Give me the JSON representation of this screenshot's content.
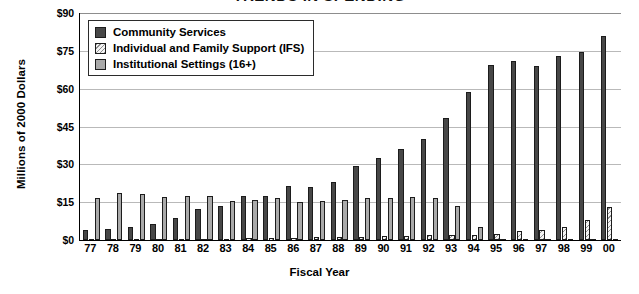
{
  "chart_data": {
    "type": "bar",
    "title": "TRENDS IN SPENDING",
    "xlabel": "Fiscal Year",
    "ylabel": "Millions of 2000 Dollars",
    "ylim": [
      0,
      90
    ],
    "yticks": [
      0,
      15,
      30,
      45,
      60,
      75,
      90
    ],
    "ytick_labels": [
      "$0",
      "$15",
      "$30",
      "$45",
      "$60",
      "$75",
      "$90"
    ],
    "grid": true,
    "legend_position": "top-left-inside",
    "categories": [
      "77",
      "78",
      "79",
      "80",
      "81",
      "82",
      "83",
      "84",
      "85",
      "86",
      "87",
      "88",
      "89",
      "90",
      "91",
      "92",
      "93",
      "94",
      "95",
      "96",
      "97",
      "98",
      "99",
      "00"
    ],
    "series": [
      {
        "name": "Community Services",
        "color": "#474747",
        "fill": "solid",
        "values": [
          4.0,
          4.3,
          5.0,
          6.5,
          8.8,
          12.3,
          13.5,
          17.5,
          17.3,
          21.5,
          21.0,
          23.0,
          29.5,
          32.5,
          36.0,
          40.0,
          48.5,
          58.5,
          69.5,
          71.0,
          69.0,
          73.0,
          74.5,
          81.0
        ]
      },
      {
        "name": "Individual and Family Support (IFS)",
        "color": "#f2f2f2",
        "fill": "diagonal-hatch",
        "values": [
          0.3,
          0.3,
          0.4,
          0.4,
          0.5,
          0.5,
          0.6,
          0.7,
          0.8,
          0.9,
          1.0,
          1.2,
          1.3,
          1.4,
          1.6,
          1.8,
          1.8,
          2.0,
          2.2,
          3.4,
          4.0,
          5.2,
          8.0,
          13.0
        ]
      },
      {
        "name": "Institutional Settings (16+)",
        "color": "#a9a9a9",
        "fill": "solid",
        "values": [
          16.5,
          18.5,
          18.3,
          17.0,
          17.5,
          17.5,
          15.5,
          16.0,
          16.5,
          15.0,
          15.5,
          16.0,
          16.5,
          16.5,
          17.0,
          16.5,
          13.5,
          5.0,
          0.6,
          0.6,
          0.5,
          0.5,
          0.5,
          0.5
        ]
      }
    ]
  }
}
